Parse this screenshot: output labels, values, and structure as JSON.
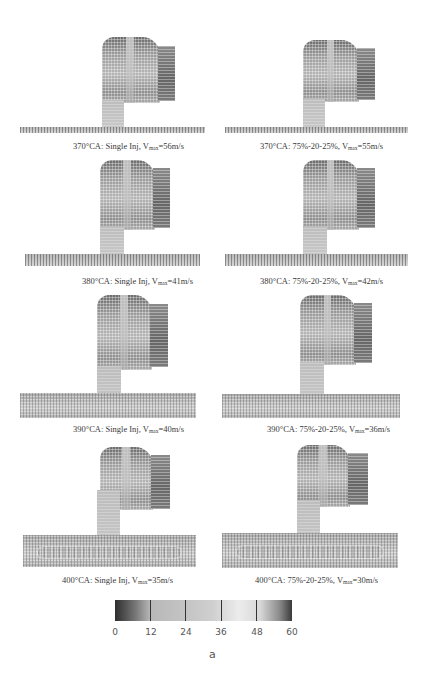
{
  "figure": {
    "label": "a",
    "panels": [
      {
        "crank_angle": "370°CA",
        "strategy": "Single Inj",
        "vmax_prefix": "V",
        "vmax_sub": "max",
        "vmax_value": "=56m/s",
        "column": "left"
      },
      {
        "crank_angle": "370°CA",
        "strategy": "75%-20-25%",
        "vmax_prefix": "V",
        "vmax_sub": "max",
        "vmax_value": "=55m/s",
        "column": "right"
      },
      {
        "crank_angle": "380°CA",
        "strategy": "Single Inj",
        "vmax_prefix": "V",
        "vmax_sub": "max",
        "vmax_value": "=41m/s",
        "column": "left"
      },
      {
        "crank_angle": "380°CA",
        "strategy": "75%-20-25%",
        "vmax_prefix": "V",
        "vmax_sub": "max",
        "vmax_value": "=42m/s",
        "column": "right"
      },
      {
        "crank_angle": "390°CA",
        "strategy": "Single Inj",
        "vmax_prefix": "V",
        "vmax_sub": "max",
        "vmax_value": "=40m/s",
        "column": "left"
      },
      {
        "crank_angle": "390°CA",
        "strategy": "75%-20-25%",
        "vmax_prefix": "V",
        "vmax_sub": "max",
        "vmax_value": "=36m/s",
        "column": "right"
      },
      {
        "crank_angle": "400°CA",
        "strategy": "Single Inj",
        "vmax_prefix": "V",
        "vmax_sub": "max",
        "vmax_value": "=35m/s",
        "column": "left"
      },
      {
        "crank_angle": "400°CA",
        "strategy": "75%-20-25%",
        "vmax_prefix": "V",
        "vmax_sub": "max",
        "vmax_value": "=30m/s",
        "column": "right"
      }
    ],
    "captions": [
      "370°CA: Single Inj, ",
      "370°CA: 75%-20-25%, ",
      "380°CA: Single Inj, ",
      "380°CA: 75%-20-25%, ",
      "390°CA: Single Inj, ",
      "390°CA: 75%-20-25%, ",
      "400°CA: Single Inj, ",
      "400°CA: 75%-20-25%, "
    ],
    "colorbar": {
      "min": 0,
      "max": 60,
      "ticks": [
        "0",
        "12",
        "24",
        "36",
        "48",
        "60"
      ],
      "colors": [
        "#2e2e2e",
        "#b8b8b8",
        "#c4c4c4",
        "#ececec",
        "#3a3a3a"
      ]
    }
  }
}
